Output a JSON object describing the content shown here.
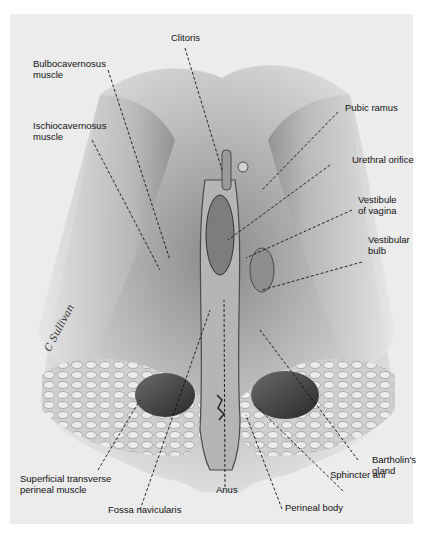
{
  "figure": {
    "type": "anatomical illustration",
    "signature": "C Sullivan",
    "background_color": "#ececec"
  },
  "labels": {
    "clitoris": "Clitoris",
    "bulbocavernosus": "Bulbocavernosus\nmuscle",
    "ischiocavernosus": "Ischiocavernosus\nmuscle",
    "pubic_ramus": "Pubic ramus",
    "urethral_orifice": "Urethral orifice",
    "vestibule": "Vestibule\nof vagina",
    "vestibular_bulb": "Vestibular\nbulb",
    "bartholin": "Bartholin's\ngland",
    "sphincter_ani": "Sphincter ani",
    "perineal_body": "Perineal body",
    "anus": "Anus",
    "fossa_navicularis": "Fossa navicularis",
    "superficial_transverse": "Superficial transverse\nperineal muscle"
  }
}
